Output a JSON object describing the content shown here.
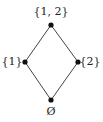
{
  "diagram": {
    "type": "hasse-diagram",
    "colors": {
      "edge": "#444444",
      "node": "#111111",
      "text": "#222222"
    },
    "nodes": [
      {
        "id": "top",
        "label": "{1, 2}",
        "x": 51,
        "y": 25,
        "label_x": 51,
        "label_y": 12
      },
      {
        "id": "left",
        "label": "{1}",
        "x": 25,
        "y": 62,
        "label_x": 12,
        "label_y": 62
      },
      {
        "id": "right",
        "label": "{2}",
        "x": 78,
        "y": 62,
        "label_x": 89,
        "label_y": 62
      },
      {
        "id": "bottom",
        "label": "Ø",
        "x": 51,
        "y": 100,
        "label_x": 51,
        "label_y": 112
      }
    ],
    "edges": [
      {
        "from": "bottom",
        "to": "left"
      },
      {
        "from": "bottom",
        "to": "right"
      },
      {
        "from": "left",
        "to": "top"
      },
      {
        "from": "right",
        "to": "top"
      }
    ]
  }
}
